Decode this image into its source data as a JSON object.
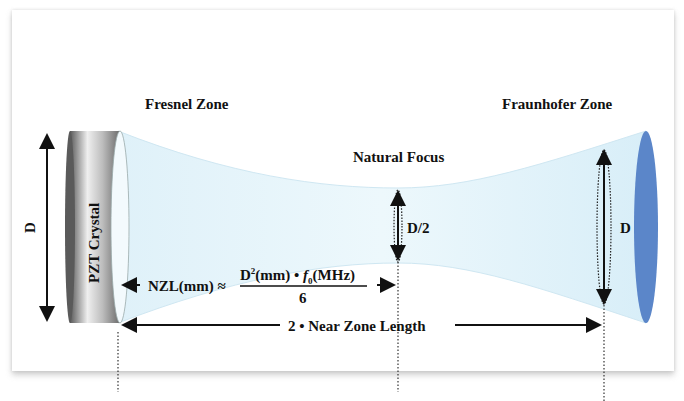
{
  "diagram": {
    "labels": {
      "fresnel_zone": "Fresnel Zone",
      "fraunhofer_zone": "Fraunhofer Zone",
      "natural_focus": "Natural Focus",
      "crystal": "PZT Crystal",
      "diameter_left": "D",
      "diameter_focus": "D/2",
      "diameter_right": "D"
    },
    "formula": {
      "lhs": "NZL(mm) ≈",
      "numerator_a": "D",
      "numerator_sup": "2",
      "numerator_b": "(mm) • ",
      "numerator_f": "f",
      "numerator_sub": "0",
      "numerator_c": "(MHz)",
      "denominator": "6"
    },
    "span_label": "2 • Near Zone Length",
    "colors": {
      "beam_fill": "#e6f5fb",
      "beam_edge": "#bfe0ee",
      "far_face": "#5b86c9",
      "crystal_dark": "#555555",
      "crystal_light": "#e8e8e8",
      "text": "#111111"
    }
  }
}
